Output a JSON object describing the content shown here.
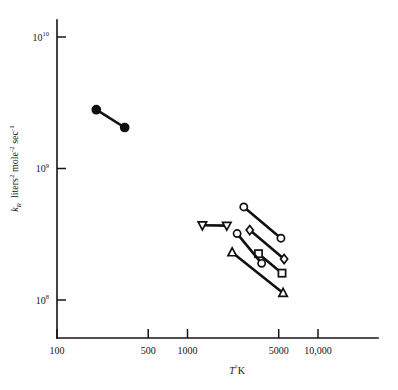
{
  "chart_data": {
    "type": "scatter",
    "title": "",
    "subtitle": "",
    "xlabel": "T°K",
    "xlabel_parts": {
      "symbol": "T",
      "degree": "°",
      "unit": "K"
    },
    "ylabel": "k_R  liters² mole⁻² sec⁻¹",
    "ylabel_parts": {
      "symbol": "k",
      "symbol_sub": "R",
      "term1": "liters",
      "term1_sup": "2",
      "term2": "mole",
      "term2_sup": "-2",
      "term3": "sec",
      "term3_sup": "-1"
    },
    "xscale": "log",
    "yscale": "log",
    "xlim": [
      100,
      20000
    ],
    "ylim": [
      50000000,
      20000000000
    ],
    "grid": false,
    "legend": "none",
    "xticks": [
      100,
      500,
      1000,
      5000,
      10000
    ],
    "xtick_labels": [
      "100",
      "500",
      "1000",
      "5000",
      "10,000"
    ],
    "yticks": [
      100000000,
      1000000000,
      10000000000
    ],
    "ytick_labels": [
      {
        "base": "10",
        "exp": "8"
      },
      {
        "base": "10",
        "exp": "9"
      },
      {
        "base": "10",
        "exp": "10"
      }
    ],
    "series": [
      {
        "name": "filled-circle-series",
        "marker": "filled-circle",
        "filled": true,
        "color": "#101010",
        "points": [
          {
            "x": 200,
            "y": 2800000000
          },
          {
            "x": 330,
            "y": 2050000000
          }
        ]
      },
      {
        "name": "down-triangle-series",
        "marker": "down-triangle",
        "filled": false,
        "color": "#101010",
        "points": [
          {
            "x": 1300,
            "y": 370000000
          },
          {
            "x": 2000,
            "y": 368000000
          }
        ]
      },
      {
        "name": "circle-series",
        "marker": "circle",
        "filled": false,
        "color": "#101010",
        "points": [
          {
            "x": 2700,
            "y": 510000000
          },
          {
            "x": 5200,
            "y": 295000000
          }
        ]
      },
      {
        "name": "diamond-series",
        "marker": "diamond",
        "filled": false,
        "color": "#101010",
        "points": [
          {
            "x": 3000,
            "y": 340000000
          },
          {
            "x": 5500,
            "y": 205000000
          }
        ]
      },
      {
        "name": "square-series",
        "marker": "square",
        "filled": false,
        "color": "#101010",
        "points": [
          {
            "x": 3500,
            "y": 225000000
          },
          {
            "x": 5300,
            "y": 160000000
          }
        ]
      },
      {
        "name": "small-circle-series",
        "marker": "circle",
        "filled": false,
        "color": "#101010",
        "points": [
          {
            "x": 2400,
            "y": 320000000
          },
          {
            "x": 3700,
            "y": 190000000
          }
        ]
      },
      {
        "name": "triangle-series",
        "marker": "up-triangle",
        "filled": false,
        "color": "#101010",
        "points": [
          {
            "x": 2200,
            "y": 230000000
          },
          {
            "x": 5400,
            "y": 113000000
          }
        ]
      }
    ]
  }
}
